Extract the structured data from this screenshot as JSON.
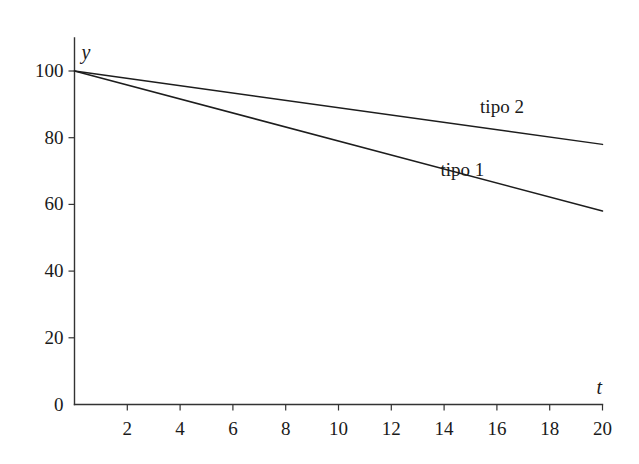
{
  "chart_data": {
    "type": "line",
    "title": "",
    "subtitle": "",
    "xlabel": "t",
    "ylabel": "y",
    "xlim": [
      0,
      20
    ],
    "ylim": [
      0,
      100
    ],
    "grid": false,
    "legend_position": "inline-annotation",
    "x_ticks": [
      2,
      4,
      6,
      8,
      10,
      12,
      14,
      16,
      18,
      20
    ],
    "x_tick_labels": [
      "2",
      "4",
      "6",
      "8",
      "10",
      "12",
      "14",
      "16",
      "18",
      "20"
    ],
    "y_ticks": [
      0,
      20,
      40,
      60,
      80,
      100
    ],
    "y_tick_labels": [
      "0",
      "20",
      "40",
      "60",
      "80",
      "100"
    ],
    "x": [
      0,
      20
    ],
    "series": [
      {
        "name": "tipo 2",
        "label": "tipo 2",
        "color": "#1d1d1d",
        "x": [
          0,
          20
        ],
        "values": [
          100,
          78
        ],
        "label_x": 16.5,
        "label_y": 89
      },
      {
        "name": "tipo 1",
        "label": "tipo 1",
        "color": "#1d1d1d",
        "x": [
          0,
          20
        ],
        "values": [
          100,
          58
        ],
        "label_x": 15.0,
        "label_y": 70
      }
    ]
  },
  "axes": {
    "y_axis_name": "y",
    "x_axis_name": "t"
  },
  "style": {
    "background": "#ffffff",
    "axis_color": "#333333",
    "line_color": "#1d1d1d",
    "text_color": "#1a1a1a"
  }
}
